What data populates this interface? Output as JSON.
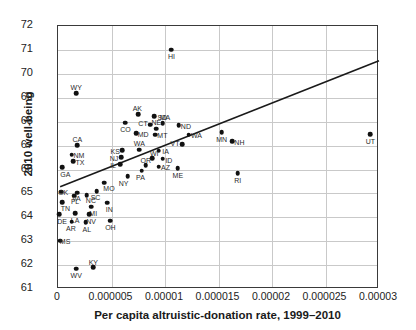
{
  "chart_data": {
    "type": "scatter",
    "title": "",
    "xlabel": "Per capita altruistic-donation rate, 1999–2010",
    "ylabel": "2010 well-being",
    "xlim": [
      0,
      3e-05
    ],
    "ylim": [
      61,
      72
    ],
    "xticks": [
      0,
      5e-06,
      1e-05,
      1.5e-05,
      2e-05,
      2.5e-05,
      3e-05
    ],
    "xticklabels": [
      "0",
      "0.000005",
      "0.00001",
      "0.000015",
      "0.00002",
      "0.000025",
      "0.00003"
    ],
    "yticks": [
      61,
      62,
      63,
      64,
      65,
      66,
      67,
      68,
      69,
      70,
      71,
      72
    ],
    "yticklabels": [
      "61",
      "62",
      "63",
      "64",
      "65",
      "66",
      "67",
      "68",
      "69",
      "70",
      "71",
      "72"
    ],
    "grid": true,
    "legend": false,
    "point_color": "#111111",
    "trendline_color": "#1a1a1a",
    "trendline": {
      "x": [
        2e-07,
        3e-05
      ],
      "y": [
        65.28,
        70.55
      ]
    },
    "points": [
      {
        "label": "HI",
        "x": 1.06e-05,
        "y": 71.0,
        "lx": 0,
        "ly": 7
      },
      {
        "label": "WY",
        "x": 1.7e-06,
        "y": 69.18,
        "lx": 0,
        "ly": -6
      },
      {
        "label": "AK",
        "x": 7.5e-06,
        "y": 68.32,
        "lx": -1,
        "ly": -6
      },
      {
        "label": "SD",
        "x": 9e-06,
        "y": 68.22,
        "lx": 8,
        "ly": 1
      },
      {
        "label": "CO",
        "x": 6.3e-06,
        "y": 67.95,
        "lx": 0,
        "ly": 7
      },
      {
        "label": "CT",
        "x": 8.6e-06,
        "y": 67.88,
        "lx": -7,
        "ly": -1
      },
      {
        "label": "MA",
        "x": 9.8e-06,
        "y": 67.94,
        "lx": 2,
        "ly": -6
      },
      {
        "label": "ND",
        "x": 1.13e-05,
        "y": 67.86,
        "lx": 7,
        "ly": 1
      },
      {
        "label": "NE",
        "x": 9.2e-06,
        "y": 67.7,
        "lx": 0,
        "ly": -6
      },
      {
        "label": "MD",
        "x": 7.3e-06,
        "y": 67.52,
        "lx": 7,
        "ly": 1
      },
      {
        "label": "MT",
        "x": 9.1e-06,
        "y": 67.45,
        "lx": 7,
        "ly": 1
      },
      {
        "label": "WA",
        "x": 1.22e-05,
        "y": 67.45,
        "lx": 8,
        "ly": 1
      },
      {
        "label": "CA",
        "x": 1.8e-06,
        "y": 67.02,
        "lx": 0,
        "ly": -6
      },
      {
        "label": "VT",
        "x": 1.16e-05,
        "y": 67.05,
        "lx": -7,
        "ly": -1
      },
      {
        "label": "KS",
        "x": 6e-06,
        "y": 66.8,
        "lx": -7,
        "ly": 1
      },
      {
        "label": "WA",
        "x": 7.6e-06,
        "y": 66.82,
        "lx": 0,
        "ly": -6
      },
      {
        "label": "IA",
        "x": 9.4e-06,
        "y": 66.78,
        "lx": 7,
        "ly": 1
      },
      {
        "label": "NM",
        "x": 1.3e-06,
        "y": 66.62,
        "lx": 7,
        "ly": 1
      },
      {
        "label": "NJ",
        "x": 5.9e-06,
        "y": 66.52,
        "lx": -7,
        "ly": 1
      },
      {
        "label": "WI",
        "x": 8.8e-06,
        "y": 66.48,
        "lx": 2,
        "ly": -5
      },
      {
        "label": "ID",
        "x": 9.8e-06,
        "y": 66.45,
        "lx": 6,
        "ly": 2
      },
      {
        "label": "TX",
        "x": 1.4e-06,
        "y": 66.35,
        "lx": 7,
        "ly": 1
      },
      {
        "label": "IL",
        "x": 5.8e-06,
        "y": 66.22,
        "lx": -7,
        "ly": 1
      },
      {
        "label": "OR",
        "x": 8.2e-06,
        "y": 66.18,
        "lx": 0,
        "ly": -5
      },
      {
        "label": "AZ",
        "x": 9.4e-06,
        "y": 66.12,
        "lx": 7,
        "ly": 1
      },
      {
        "label": "ME",
        "x": 1.12e-05,
        "y": 66.05,
        "lx": 0,
        "ly": 7
      },
      {
        "label": "GA",
        "x": 4e-07,
        "y": 66.1,
        "lx": 3,
        "ly": 7
      },
      {
        "label": "PA",
        "x": 7.8e-06,
        "y": 65.95,
        "lx": -1,
        "ly": 7
      },
      {
        "label": "RI",
        "x": 1.68e-05,
        "y": 65.85,
        "lx": 0,
        "ly": 7
      },
      {
        "label": "NY",
        "x": 6.5e-06,
        "y": 65.72,
        "lx": -4,
        "ly": 7
      },
      {
        "label": "MO",
        "x": 4.3e-06,
        "y": 65.45,
        "lx": 5,
        "ly": 6
      },
      {
        "label": "OK",
        "x": 3e-07,
        "y": 65.06,
        "lx": 2,
        "ly": 1
      },
      {
        "label": "SC",
        "x": 3.6e-06,
        "y": 65.1,
        "lx": -1,
        "ly": 6
      },
      {
        "label": "VA",
        "x": 1.8e-06,
        "y": 65.02,
        "lx": -1,
        "ly": 6
      },
      {
        "label": "FL",
        "x": 1.5e-06,
        "y": 64.9,
        "lx": 1,
        "ly": 6
      },
      {
        "label": "NC",
        "x": 2.7e-06,
        "y": 64.92,
        "lx": 4,
        "ly": 5
      },
      {
        "label": "TN",
        "x": 4e-07,
        "y": 64.62,
        "lx": 3,
        "ly": 6
      },
      {
        "label": "MI",
        "x": 3.1e-06,
        "y": 64.45,
        "lx": 2,
        "ly": 7
      },
      {
        "label": "IN",
        "x": 4.6e-06,
        "y": 64.6,
        "lx": 2,
        "ly": 7
      },
      {
        "label": "DE",
        "x": 1e-07,
        "y": 64.12,
        "lx": 3,
        "ly": 7
      },
      {
        "label": "LA",
        "x": 1.6e-06,
        "y": 64.18,
        "lx": 0,
        "ly": 7
      },
      {
        "label": "NV",
        "x": 2.9e-06,
        "y": 64.12,
        "lx": 2,
        "ly": 7
      },
      {
        "label": "AR",
        "x": 1.3e-06,
        "y": 63.82,
        "lx": -1,
        "ly": 7
      },
      {
        "label": "AL",
        "x": 2.6e-06,
        "y": 63.8,
        "lx": 1,
        "ly": 7
      },
      {
        "label": "OH",
        "x": 4.9e-06,
        "y": 63.85,
        "lx": 0,
        "ly": 7
      },
      {
        "label": "MS",
        "x": 2e-07,
        "y": 63.02,
        "lx": 5,
        "ly": 1
      },
      {
        "label": "WV",
        "x": 1.7e-06,
        "y": 61.85,
        "lx": 0,
        "ly": 7
      },
      {
        "label": "KY",
        "x": 3.3e-06,
        "y": 61.92,
        "lx": 0,
        "ly": -5
      },
      {
        "label": "MN",
        "x": 1.53e-05,
        "y": 67.55,
        "lx": 0,
        "ly": 7
      },
      {
        "label": "NH",
        "x": 1.63e-05,
        "y": 67.18,
        "lx": 7,
        "ly": 1
      },
      {
        "label": "UT",
        "x": 2.92e-05,
        "y": 67.48,
        "lx": 0,
        "ly": 7
      }
    ]
  }
}
